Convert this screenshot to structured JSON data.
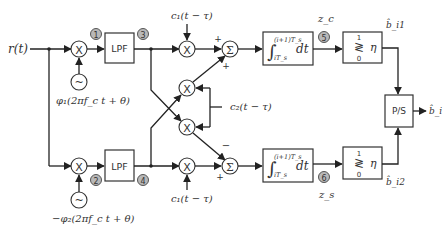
{
  "diagram": {
    "input_label": "r(t)",
    "upper_branch": {
      "oscillator_label": "φ₁(2πf_c t + θ)",
      "mixer_symbol": "X",
      "lpf_label": "LPF",
      "point_after_mixer": "1",
      "point_after_lpf": "3",
      "code_label": "c₁(t − τ)",
      "sum_symbol": "Σ",
      "sum_signs": [
        "+",
        "+"
      ],
      "integrator_upper": "(i+1)T_s",
      "integrator_lower": "iT_s",
      "integrator_dt": "dt",
      "point_after_integrator": "5",
      "decision_var": "z_c",
      "threshold_top": "1",
      "threshold_bottom": "0",
      "threshold_symbol": "≷",
      "threshold_eta": "η",
      "output_bit": "b̂_i1"
    },
    "lower_branch": {
      "oscillator_label": "−φ₂(2πf_c t + θ)",
      "mixer_symbol": "X",
      "lpf_label": "LPF",
      "point_after_mixer": "2",
      "point_after_lpf": "4",
      "code_label": "c₁(t − τ)",
      "sum_symbol": "Σ",
      "sum_signs": [
        "−",
        "+"
      ],
      "integrator_upper": "(i+1)T_s",
      "integrator_lower": "iT_s",
      "integrator_dt": "dt",
      "point_after_integrator": "6",
      "decision_var": "z_s",
      "threshold_top": "1",
      "threshold_bottom": "0",
      "threshold_symbol": "≷",
      "threshold_eta": "η",
      "output_bit": "b̂_i2"
    },
    "cross_code_label": "c₂(t − τ)",
    "cross_mixer_symbol": "X",
    "oscillator_symbol": "~",
    "ps_label": "P/S",
    "final_output": "b̂_i"
  }
}
